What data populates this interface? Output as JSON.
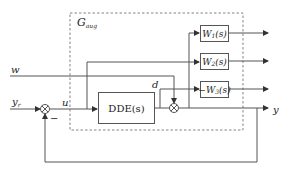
{
  "diagram": {
    "group": {
      "label_main": "G",
      "label_sub": "aug"
    },
    "blocks": {
      "dde": "DDE(s)",
      "w1": {
        "main": "W",
        "sub": "1",
        "arg": "(s)"
      },
      "w2": {
        "main": "W",
        "sub": "2",
        "arg": "(s)"
      },
      "w3": {
        "prefix": "−",
        "main": "W",
        "sub": "3",
        "arg": "(s)"
      }
    },
    "signals": {
      "reference": {
        "main": "y",
        "sub": "r"
      },
      "control": "u",
      "disturbance_input": "w",
      "disturbance": "d",
      "output": "y",
      "feedback_sign": "−"
    },
    "colors": {
      "line": "#555555",
      "dashed": "#777777",
      "text": "#222222"
    }
  }
}
